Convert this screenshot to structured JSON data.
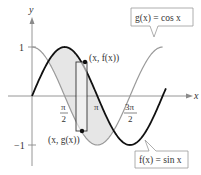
{
  "diagram": {
    "type": "function-plot",
    "axes": {
      "x_label": "x",
      "y_label": "y",
      "y_ticks": [
        {
          "value": 1,
          "label": "1"
        },
        {
          "value": -1,
          "label": "−1"
        }
      ],
      "x_ticks": [
        {
          "value": "pi/2",
          "num": "π",
          "den": "2"
        },
        {
          "value": "pi",
          "label": "π"
        },
        {
          "value": "3pi/2",
          "num": "3π",
          "den": "2"
        }
      ]
    },
    "curves": [
      {
        "name": "f",
        "expr": "sin",
        "label": "f(x) = sin x",
        "color": "#111111",
        "stroke_width": 1.8
      },
      {
        "name": "g",
        "expr": "cos",
        "label": "g(x) = cos x",
        "color": "#9a9a9a",
        "stroke_width": 1.2
      }
    ],
    "shaded_region": {
      "from": "pi/4",
      "to": "5pi/4",
      "between": [
        "f",
        "g"
      ],
      "color": "#e6e6e6"
    },
    "representative_rectangle": {
      "top_point_label": "(x, f(x))",
      "bottom_point_label": "(x, g(x))"
    }
  },
  "labels": {
    "y_axis": "y",
    "x_axis": "x",
    "tick_one": "1",
    "tick_neg_one": "−1",
    "pi_half_num": "π",
    "pi_half_den": "2",
    "pi": "π",
    "three_pi_half_num": "3π",
    "three_pi_half_den": "2",
    "top_point": "(x, f(x))",
    "bottom_point": "(x, g(x))",
    "g_label": "g(x) = cos x",
    "f_label": "f(x) = sin x"
  }
}
